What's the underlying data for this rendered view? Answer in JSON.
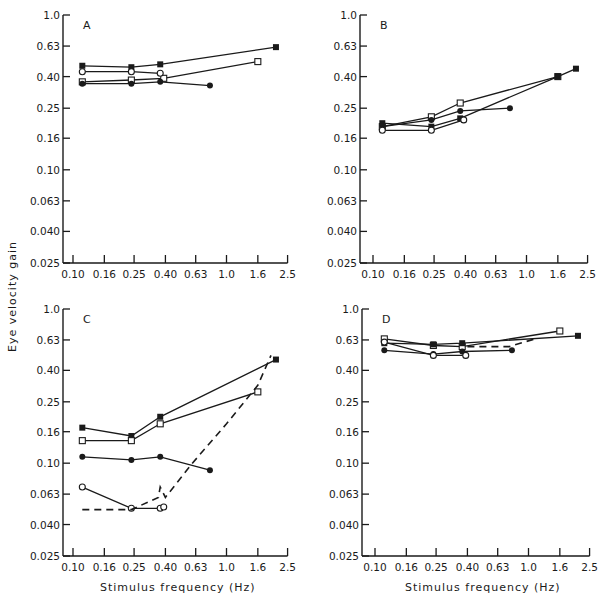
{
  "figure": {
    "ylabel": "Eye velocity gain",
    "xlabel": "Stimulus frequency (Hz)"
  },
  "chart_data": [
    {
      "type": "line",
      "panel": "A",
      "title": "A",
      "xlabel": "",
      "ylabel": "Eye velocity gain",
      "xscale": "log",
      "yscale": "log",
      "xlim": [
        0.09,
        2.5
      ],
      "ylim": [
        0.025,
        1.0
      ],
      "x_ticks": [
        "0.10",
        "0.16",
        "0.25",
        "0.40",
        "0.63",
        "1.0",
        "1.6",
        "2.5"
      ],
      "y_ticks": [
        "1.0",
        "0.63",
        "0.40",
        "0.25",
        "0.16",
        "0.10",
        "0.063",
        "0.040",
        "0.025"
      ],
      "grid": false,
      "series": [
        {
          "name": "filled-square-1",
          "marker": "square-filled",
          "dash": false,
          "x": [
            0.115,
            0.24,
            0.37,
            2.1
          ],
          "y": [
            0.47,
            0.46,
            0.48,
            0.62
          ]
        },
        {
          "name": "open-square",
          "marker": "square-open",
          "dash": false,
          "x": [
            0.115,
            0.24,
            0.39,
            1.6
          ],
          "y": [
            0.37,
            0.38,
            0.39,
            0.5
          ]
        },
        {
          "name": "open-circle",
          "marker": "circle-open",
          "dash": false,
          "x": [
            0.115,
            0.24,
            0.37
          ],
          "y": [
            0.43,
            0.43,
            0.42
          ]
        },
        {
          "name": "filled-circle",
          "marker": "circle-filled",
          "dash": false,
          "x": [
            0.115,
            0.24,
            0.37,
            0.78
          ],
          "y": [
            0.36,
            0.36,
            0.37,
            0.35
          ]
        }
      ]
    },
    {
      "type": "line",
      "panel": "B",
      "title": "B",
      "xscale": "log",
      "yscale": "log",
      "xlim": [
        0.09,
        2.5
      ],
      "ylim": [
        0.025,
        1.0
      ],
      "x_ticks": [
        "0.10",
        "0.16",
        "0.25",
        "0.40",
        "0.63",
        "1.0",
        "1.6",
        "2.5"
      ],
      "y_ticks": [
        "1.0",
        "0.63",
        "0.40",
        "0.25",
        "0.16",
        "0.10",
        "0.063",
        "0.040",
        "0.025"
      ],
      "grid": false,
      "series": [
        {
          "name": "open-square",
          "marker": "square-open",
          "dash": false,
          "x": [
            0.115,
            0.24,
            0.37,
            1.6
          ],
          "y": [
            0.19,
            0.22,
            0.27,
            0.4
          ]
        },
        {
          "name": "filled-circle",
          "marker": "circle-filled",
          "dash": false,
          "x": [
            0.115,
            0.24,
            0.37,
            0.78
          ],
          "y": [
            0.19,
            0.21,
            0.24,
            0.25
          ]
        },
        {
          "name": "filled-square",
          "marker": "square-filled",
          "dash": false,
          "x": [
            0.115,
            0.24,
            0.37,
            1.6,
            2.1
          ],
          "y": [
            0.2,
            0.19,
            0.215,
            0.4,
            0.45
          ]
        },
        {
          "name": "open-circle",
          "marker": "circle-open",
          "dash": false,
          "x": [
            0.115,
            0.24,
            0.39
          ],
          "y": [
            0.18,
            0.18,
            0.21
          ]
        }
      ]
    },
    {
      "type": "line",
      "panel": "C",
      "title": "C",
      "xscale": "log",
      "yscale": "log",
      "xlim": [
        0.09,
        2.5
      ],
      "ylim": [
        0.025,
        1.0
      ],
      "x_ticks": [
        "0.10",
        "0.16",
        "0.25",
        "0.40",
        "0.63",
        "1.0",
        "1.6",
        "2.5"
      ],
      "y_ticks": [
        "1.0",
        "0.63",
        "0.40",
        "0.25",
        "0.16",
        "0.10",
        "0.063",
        "0.040",
        "0.025"
      ],
      "xlabel": "Stimulus frequency (Hz)",
      "grid": false,
      "series": [
        {
          "name": "filled-square",
          "marker": "square-filled",
          "dash": false,
          "x": [
            0.115,
            0.24,
            0.37,
            2.1
          ],
          "y": [
            0.17,
            0.15,
            0.2,
            0.47
          ]
        },
        {
          "name": "open-square",
          "marker": "square-open",
          "dash": false,
          "x": [
            0.115,
            0.24,
            0.37,
            1.6
          ],
          "y": [
            0.14,
            0.14,
            0.18,
            0.29
          ]
        },
        {
          "name": "filled-circle",
          "marker": "circle-filled",
          "dash": false,
          "x": [
            0.115,
            0.24,
            0.37,
            0.78
          ],
          "y": [
            0.11,
            0.105,
            0.11,
            0.09
          ]
        },
        {
          "name": "open-circle",
          "marker": "circle-open",
          "dash": false,
          "x": [
            0.115,
            0.24,
            0.37,
            0.39
          ],
          "y": [
            0.07,
            0.051,
            0.051,
            0.052
          ]
        },
        {
          "name": "dashed-reference",
          "marker": "none",
          "dash": true,
          "x": [
            0.115,
            0.24,
            0.36,
            0.37,
            0.4,
            0.6,
            1.0,
            1.6,
            1.95
          ],
          "y": [
            0.05,
            0.05,
            0.06,
            0.07,
            0.06,
            0.1,
            0.18,
            0.32,
            0.5
          ]
        }
      ]
    },
    {
      "type": "line",
      "panel": "D",
      "title": "D",
      "xscale": "log",
      "yscale": "log",
      "xlim": [
        0.09,
        2.5
      ],
      "ylim": [
        0.025,
        1.0
      ],
      "x_ticks": [
        "0.10",
        "0.16",
        "0.25",
        "0.40",
        "0.63",
        "1.0",
        "1.6",
        "2.5"
      ],
      "y_ticks": [
        "1.0",
        "0.63",
        "0.40",
        "0.25",
        "0.16",
        "0.10",
        "0.063",
        "0.040",
        "0.025"
      ],
      "xlabel": "Stimulus frequency (Hz)",
      "grid": false,
      "series": [
        {
          "name": "open-square",
          "marker": "square-open",
          "dash": false,
          "x": [
            0.115,
            0.24,
            0.37,
            1.6
          ],
          "y": [
            0.64,
            0.58,
            0.57,
            0.72
          ]
        },
        {
          "name": "filled-square",
          "marker": "square-filled",
          "dash": false,
          "x": [
            0.115,
            0.24,
            0.37,
            2.1
          ],
          "y": [
            0.6,
            0.59,
            0.6,
            0.67
          ]
        },
        {
          "name": "filled-circle",
          "marker": "circle-filled",
          "dash": false,
          "x": [
            0.115,
            0.24,
            0.37,
            0.78
          ],
          "y": [
            0.54,
            0.51,
            0.53,
            0.54
          ]
        },
        {
          "name": "open-circle",
          "marker": "circle-open",
          "dash": false,
          "x": [
            0.115,
            0.24,
            0.39
          ],
          "y": [
            0.61,
            0.5,
            0.5
          ]
        },
        {
          "name": "dashed-reference",
          "marker": "none",
          "dash": true,
          "x": [
            0.4,
            0.75,
            1.1
          ],
          "y": [
            0.57,
            0.57,
            0.64
          ]
        }
      ]
    }
  ]
}
